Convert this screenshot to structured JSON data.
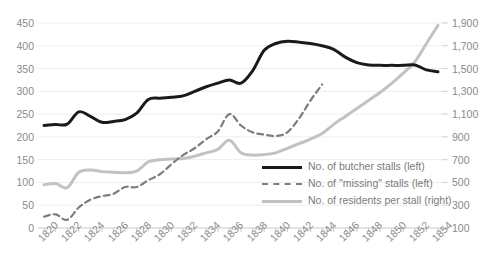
{
  "chart_data": {
    "type": "line",
    "title": "",
    "subtitle": "",
    "xlabel": "",
    "ylabel": "",
    "grid": true,
    "legend_position": "inside-bottom-right",
    "x": [
      1820,
      1821,
      1822,
      1823,
      1824,
      1825,
      1826,
      1827,
      1828,
      1829,
      1830,
      1831,
      1832,
      1833,
      1834,
      1835,
      1836,
      1837,
      1838,
      1839,
      1840,
      1841,
      1842,
      1843,
      1844,
      1845,
      1846,
      1847,
      1848,
      1849,
      1850,
      1851,
      1852,
      1853,
      1854
    ],
    "x_tick_labels": [
      "1820",
      "1822",
      "1824",
      "1826",
      "1828",
      "1830",
      "1832",
      "1834",
      "1836",
      "1838",
      "1840",
      "1842",
      "1844",
      "1846",
      "1848",
      "1850",
      "1852",
      "1854"
    ],
    "left_axis": {
      "label": "",
      "ylim": [
        0,
        450
      ],
      "ticks": [
        0,
        50,
        100,
        150,
        200,
        250,
        300,
        350,
        400,
        450
      ],
      "tick_labels": [
        "0",
        "50",
        "100",
        "150",
        "200",
        "250",
        "300",
        "350",
        "400",
        "450"
      ]
    },
    "right_axis": {
      "label": "",
      "ylim": [
        100,
        1900
      ],
      "ticks": [
        100,
        300,
        500,
        700,
        900,
        1100,
        1300,
        1500,
        1700,
        1900
      ],
      "tick_labels": [
        "100",
        "300",
        "500",
        "700",
        "900",
        "1,100",
        "1,300",
        "1,500",
        "1,700",
        "1,900"
      ]
    },
    "series": [
      {
        "name": "No. of butcher stalls (left)",
        "legend_label": "No. of butcher stalls (left)",
        "axis": "left",
        "style": "solid",
        "color": "#1a1a1a",
        "width": 3,
        "values": [
          225,
          227,
          228,
          255,
          245,
          232,
          234,
          238,
          252,
          282,
          285,
          287,
          290,
          300,
          310,
          318,
          325,
          318,
          345,
          390,
          405,
          410,
          408,
          405,
          400,
          392,
          375,
          363,
          358,
          357,
          357,
          357,
          358,
          347,
          343
        ]
      },
      {
        "name": "No. of \"missing\" stalls (left)",
        "legend_label": "No. of \"missing\" stalls (left)",
        "axis": "left",
        "style": "dashed",
        "color": "#7d7d7d",
        "width": 2.2,
        "values": [
          25,
          30,
          18,
          45,
          62,
          70,
          75,
          90,
          90,
          105,
          118,
          140,
          160,
          175,
          195,
          212,
          250,
          225,
          210,
          205,
          202,
          210,
          240,
          280,
          315,
          null,
          null,
          null,
          null,
          null,
          null,
          null,
          null,
          null,
          null
        ]
      },
      {
        "name": "No. of residents per stall (right)",
        "legend_label": "No. of residents per stall (right)",
        "axis": "right",
        "style": "solid",
        "color": "#c2c2c2",
        "width": 3,
        "values": [
          480,
          490,
          455,
          590,
          610,
          595,
          590,
          585,
          600,
          680,
          700,
          705,
          710,
          730,
          760,
          790,
          870,
          760,
          740,
          745,
          760,
          800,
          840,
          880,
          930,
          1010,
          1080,
          1150,
          1220,
          1290,
          1370,
          1460,
          1560,
          1720,
          1880
        ]
      }
    ]
  },
  "colors": {
    "butcher": "#1a1a1a",
    "missing": "#7d7d7d",
    "residents": "#c2c2c2",
    "grid": "#ededed",
    "text": "#8a8a8a"
  }
}
